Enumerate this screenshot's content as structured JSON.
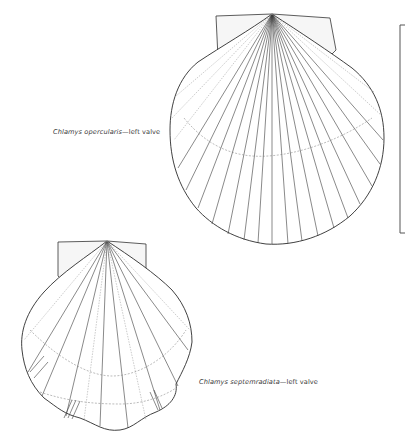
{
  "figure": {
    "specimens": [
      {
        "id": "top",
        "species": "Chlamys opercularis",
        "separator": "—",
        "view": "left valve",
        "caption": "Chlamys opercularis—left valve"
      },
      {
        "id": "bottom",
        "species": "Chlamys septemradiata",
        "separator": "—",
        "view": "left valve",
        "caption": "Chlamys septemradiata—left valve"
      }
    ],
    "scale_bar": {
      "orientation": "vertical",
      "position": "right"
    },
    "colors": {
      "ink": "#2b2b2b",
      "background": "#ffffff"
    }
  }
}
